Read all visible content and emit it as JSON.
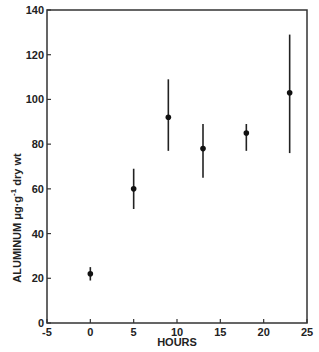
{
  "chart_data": {
    "type": "scatter",
    "title": "",
    "xlabel": "HOURS",
    "ylabel": "ALUMINUM μg·g⁻¹ dry wt",
    "ylabel_parts": {
      "main": "ALUMINUM μg·g",
      "sup": "-1",
      "tail": " dry wt"
    },
    "xlim": [
      -5,
      25
    ],
    "ylim": [
      0,
      140
    ],
    "xticks": [
      -5,
      0,
      5,
      10,
      15,
      20,
      25
    ],
    "yticks": [
      0,
      20,
      40,
      60,
      80,
      100,
      120,
      140
    ],
    "grid": false,
    "legend": null,
    "series": [
      {
        "name": "Aluminum",
        "points": [
          {
            "x": 0,
            "y": 22,
            "err_low": 19,
            "err_high": 25
          },
          {
            "x": 5,
            "y": 60,
            "err_low": 51,
            "err_high": 69
          },
          {
            "x": 9,
            "y": 92,
            "err_low": 77,
            "err_high": 109
          },
          {
            "x": 13,
            "y": 78,
            "err_low": 65,
            "err_high": 89
          },
          {
            "x": 18,
            "y": 85,
            "err_low": 77,
            "err_high": 89
          },
          {
            "x": 23,
            "y": 103,
            "err_low": 76,
            "err_high": 129
          }
        ]
      }
    ]
  }
}
